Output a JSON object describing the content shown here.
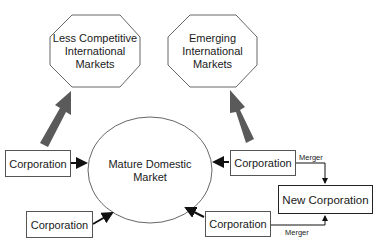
{
  "diagram": {
    "international_nodes": [
      {
        "id": "less-competitive",
        "lines": [
          "Less Competitive",
          "International",
          "Markets"
        ]
      },
      {
        "id": "emerging",
        "lines": [
          "Emerging",
          "International",
          "Markets"
        ]
      }
    ],
    "center_node": {
      "lines": [
        "Mature Domestic",
        "Market"
      ]
    },
    "corporations": [
      {
        "label": "Corporation",
        "position": "left-upper"
      },
      {
        "label": "Corporation",
        "position": "left-lower"
      },
      {
        "label": "Corporation",
        "position": "right-upper"
      },
      {
        "label": "Corporation",
        "position": "right-lower"
      }
    ],
    "merger_result": {
      "label": "New Corporation"
    },
    "merger_labels": [
      "Merger",
      "Merger"
    ],
    "colors": {
      "big_arrow": "#5a5a5a",
      "outline": "#555555",
      "text": "#1a1a1a"
    }
  }
}
